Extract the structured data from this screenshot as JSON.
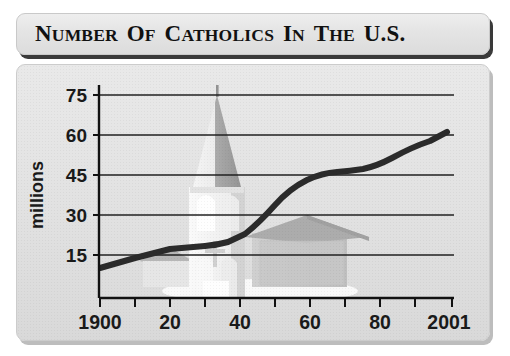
{
  "title": {
    "full": "NUMBER OF CATHOLICS IN THE U.S.",
    "words": [
      {
        "cap": "N",
        "rest": "umber"
      },
      {
        "cap": "O",
        "rest": "f"
      },
      {
        "cap": "C",
        "rest": "atholics"
      },
      {
        "cap": "I",
        "rest": "n"
      },
      {
        "cap": "T",
        "rest": "he"
      },
      {
        "cap": "U.S.",
        "rest": ""
      }
    ]
  },
  "graphic": {
    "church_label": "church-watermark",
    "cross_label": "cross-icon"
  },
  "colors": {
    "line": "#2b2b2b",
    "gridline": "#1f1f1f",
    "axis": "#111111",
    "panel_background": "#e3e3e3",
    "title_background": "#e6e6e6",
    "text": "#111111",
    "church_light": "#f4f4f4",
    "church_mid": "#b8b8b8",
    "church_dark": "#9a9a9a"
  },
  "chart_data": {
    "type": "line",
    "xlabel": "",
    "ylabel": "millions",
    "xlim": [
      1900,
      2001
    ],
    "ylim": [
      0,
      82
    ],
    "yticks": [
      15,
      30,
      45,
      60,
      75
    ],
    "ytick_labels": [
      "15",
      "30",
      "45",
      "60",
      "75"
    ],
    "xticks": [
      1900,
      1910,
      1920,
      1930,
      1940,
      1950,
      1960,
      1970,
      1980,
      1990,
      2001
    ],
    "xtick_labels": [
      "1900",
      "",
      "20",
      "",
      "40",
      "",
      "60",
      "",
      "80",
      "",
      "2001"
    ],
    "xtick_labels_shown": [
      "1900",
      "20",
      "40",
      "60",
      "80",
      "2001"
    ],
    "grid": true,
    "grid_axis": "y",
    "legend": false,
    "series": [
      {
        "name": "Catholics in the U.S. (millions)",
        "x": [
          1900,
          1910,
          1920,
          1930,
          1940,
          1950,
          1960,
          1965,
          1970,
          1975,
          1980,
          1990,
          2001
        ],
        "values": [
          11,
          14.5,
          17,
          18,
          19.5,
          27,
          41,
          45.5,
          46.5,
          47,
          49,
          56,
          62
        ]
      }
    ]
  }
}
